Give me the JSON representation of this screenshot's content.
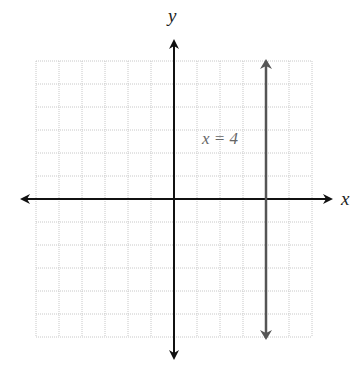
{
  "chart_data": {
    "type": "line",
    "title": "",
    "xlabel": "x",
    "ylabel": "y",
    "xlim": [
      -6,
      6
    ],
    "ylim": [
      -6,
      6
    ],
    "grid": true,
    "grid_step": 1,
    "series": [
      {
        "name": "x = 4",
        "kind": "vertical-line",
        "x": [
          4,
          4
        ],
        "y": [
          -6,
          6
        ],
        "color": "#555555"
      }
    ],
    "annotations": [
      {
        "text": "x = 4",
        "x": 1.3,
        "y": 3.5
      }
    ]
  },
  "labels": {
    "x_axis": "x",
    "y_axis": "y",
    "line_label": "x = 4"
  },
  "colors": {
    "grid": "#c8c8c8",
    "axis": "#111111",
    "line": "#555555"
  }
}
